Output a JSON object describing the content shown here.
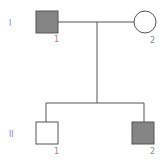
{
  "diagram": {
    "type": "pedigree",
    "generations": [
      {
        "label": "I",
        "individuals": [
          {
            "number": "1",
            "sex": "male",
            "affected": true
          },
          {
            "number": "2",
            "sex": "female",
            "affected": false
          }
        ]
      },
      {
        "label": "II",
        "individuals": [
          {
            "number": "1",
            "sex": "male",
            "affected": false
          },
          {
            "number": "2",
            "sex": "male",
            "affected": true
          }
        ]
      }
    ],
    "colors": {
      "affected_fill": "#858585",
      "unaffected_fill": "#ffffff",
      "line": "#555555",
      "label": "#8a8a8a"
    }
  }
}
